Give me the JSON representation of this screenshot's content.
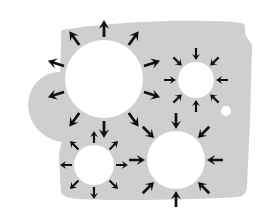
{
  "figure": {
    "canvas": {
      "width": 269,
      "height": 215,
      "background": "#ffffff"
    },
    "slab": {
      "name": "gray-slab",
      "fill": "#cfcfcf",
      "description": "irregular gray quadrilateral slab with concave notch on left edge",
      "path": "M 62,30 C 110,22 175,20 208,21 C 228,21 240,22 244,24 C 246,27 244,31 246,36 C 249,41 252,42 252,48 L 250,120 L 247,186 C 247,192 244,196 238,197 C 190,200 120,201 78,199 C 68,198 62,196 61,192 L 59,160 C 59,152 60,146 62,142 C 48,140 36,131 31,119 C 26,106 28,92 36,83 C 43,75 52,72 60,72 L 61,45 C 61,36 61,32 62,30 Z"
    },
    "circles": [
      {
        "name": "circle-top-left",
        "label": "large divergent source",
        "cx": 104,
        "cy": 79,
        "r": 39,
        "fill": "#ffffff",
        "direction": "outward",
        "arrow_count": 10,
        "arrow_length": 17,
        "arrow_width": 4.4,
        "arrow_gap": 3,
        "angle_offset": 0
      },
      {
        "name": "circle-top-right",
        "label": "small convergent sink",
        "cx": 196,
        "cy": 80,
        "r": 18,
        "fill": "#ffffff",
        "direction": "inward",
        "arrow_count": 8,
        "arrow_length": 12,
        "arrow_width": 3.4,
        "arrow_gap": 2,
        "angle_offset": 0
      },
      {
        "name": "circle-bottom-left",
        "label": "small divergent source",
        "cx": 94,
        "cy": 165,
        "r": 20,
        "fill": "#ffffff",
        "direction": "outward",
        "arrow_count": 8,
        "arrow_length": 12,
        "arrow_width": 3.4,
        "arrow_gap": 2,
        "angle_offset": 0
      },
      {
        "name": "circle-bottom-right",
        "label": "medium convergent sink",
        "cx": 176,
        "cy": 160,
        "r": 29,
        "fill": "#ffffff",
        "direction": "inward",
        "arrow_count": 8,
        "arrow_length": 16,
        "arrow_width": 4.2,
        "arrow_gap": 2,
        "angle_offset": 0
      }
    ],
    "dots": [
      {
        "name": "small-white-dot",
        "cx": 226,
        "cy": 111,
        "r": 5,
        "fill": "#ffffff"
      }
    ],
    "arrow_color": "#111111"
  }
}
